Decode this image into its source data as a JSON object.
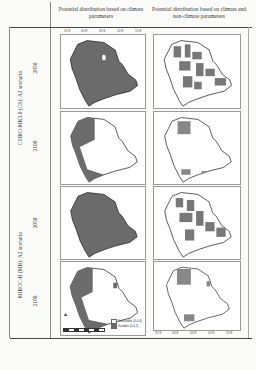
{
  "header": {
    "col1": "Potential distribution based on climate parameters",
    "col2": "Potential distribution based on climate and non-climate parameters"
  },
  "scenarios": [
    {
      "label": "CSIRO-MK3.0 (CS): A2 scenario",
      "years": [
        "2050",
        "2100"
      ]
    },
    {
      "label": "MIROC-H (MR): A2 scenario",
      "years": [
        "2050",
        "2100"
      ]
    }
  ],
  "axis": {
    "lon_ticks": [
      "35°E",
      "40°E",
      "45°E",
      "50°E",
      "55°E"
    ],
    "lat_ticks": [
      "30°N",
      "25°N",
      "20°N",
      "15°N"
    ]
  },
  "legend": {
    "unsuitable": "Unsuitable (0-0.4)",
    "suitable": "Suitable (0.4-1)",
    "scale": "0 300 600 1,200 Km",
    "north": "N",
    "colors": {
      "suitable": "#6b6b6b",
      "unsuitable": "#ffffff"
    }
  },
  "maps": [
    {
      "row": "CS 2050",
      "col": "climate",
      "fill": "mostly-suitable"
    },
    {
      "row": "CS 2050",
      "col": "climate+non-climate",
      "fill": "patchy"
    },
    {
      "row": "CS 2100",
      "col": "climate",
      "fill": "western-strip"
    },
    {
      "row": "CS 2100",
      "col": "climate+non-climate",
      "fill": "sparse-north"
    },
    {
      "row": "MR 2050",
      "col": "climate",
      "fill": "mostly-suitable"
    },
    {
      "row": "MR 2050",
      "col": "climate+non-climate",
      "fill": "patchy"
    },
    {
      "row": "MR 2100",
      "col": "climate",
      "fill": "western-strip"
    },
    {
      "row": "MR 2100",
      "col": "climate+non-climate",
      "fill": "sparse-north"
    }
  ]
}
